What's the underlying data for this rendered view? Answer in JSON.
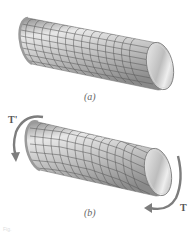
{
  "figure_a": {
    "label": "(a)",
    "description": "Undeformed circular shaft with square grid on surface",
    "grid": {
      "rows": 8,
      "columns": 16
    }
  },
  "figure_b": {
    "label": "(b)",
    "description": "Shaft twisted by end torques; grid distorted into rhombi",
    "torque_left": "T'",
    "torque_right": "T",
    "grid": {
      "rows": 8,
      "columns": 16
    }
  },
  "colors": {
    "shaft_light": "#e6e6e6",
    "shaft_mid": "#b5b5b5",
    "shaft_dark": "#8a8a8a",
    "grid_line": "#5a5a5a",
    "arrow": "#7d7d7d",
    "label": "#666666"
  },
  "caption": "Fig."
}
